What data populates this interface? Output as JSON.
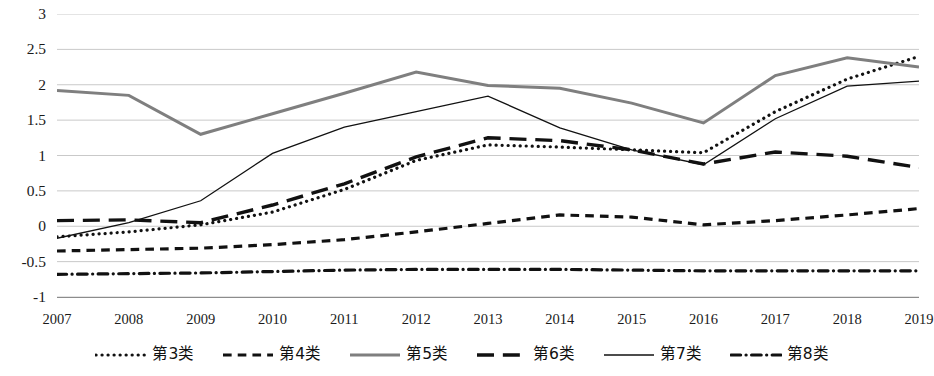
{
  "chart_data": {
    "type": "line",
    "title": "",
    "xlabel": "",
    "ylabel": "",
    "categories": [
      "2007",
      "2008",
      "2009",
      "2010",
      "2011",
      "2012",
      "2013",
      "2014",
      "2015",
      "2016",
      "2017",
      "2018",
      "2019"
    ],
    "x": [
      2007,
      2008,
      2009,
      2010,
      2011,
      2012,
      2013,
      2014,
      2015,
      2016,
      2017,
      2018,
      2019
    ],
    "ylim": [
      -1,
      3
    ],
    "y_ticks": [
      3,
      2.5,
      2,
      1.5,
      1,
      0.5,
      0,
      -0.5,
      -1
    ],
    "y_tick_labels": [
      "3",
      "2.5",
      "2",
      "1.5",
      "1",
      "0.5",
      "0",
      "-0.5",
      "-1"
    ],
    "grid": true,
    "legend_position": "bottom",
    "series": [
      {
        "name": "第3类",
        "style": "dotted",
        "color": "#111111",
        "width": 3.2,
        "values": [
          -0.15,
          -0.08,
          0.02,
          0.2,
          0.52,
          0.93,
          1.15,
          1.12,
          1.08,
          1.04,
          1.62,
          2.08,
          2.4
        ]
      },
      {
        "name": "第4类",
        "style": "dashed",
        "color": "#111111",
        "width": 3.2,
        "values": [
          -0.35,
          -0.33,
          -0.31,
          -0.26,
          -0.19,
          -0.08,
          0.04,
          0.16,
          0.13,
          0.02,
          0.08,
          0.16,
          0.25
        ]
      },
      {
        "name": "第5类",
        "style": "solid",
        "color": "#7f7f7f",
        "width": 3.0,
        "values": [
          1.92,
          1.85,
          1.3,
          1.59,
          1.88,
          2.18,
          1.99,
          1.95,
          1.74,
          1.46,
          2.13,
          2.38,
          2.25
        ]
      },
      {
        "name": "第6类",
        "style": "longdash",
        "color": "#111111",
        "width": 3.4,
        "values": [
          0.08,
          0.09,
          0.05,
          0.3,
          0.6,
          0.98,
          1.25,
          1.21,
          1.08,
          0.88,
          1.05,
          0.99,
          0.83
        ]
      },
      {
        "name": "第7类",
        "style": "solid",
        "color": "#111111",
        "width": 1.3,
        "values": [
          -0.17,
          0.05,
          0.36,
          1.03,
          1.4,
          1.62,
          1.84,
          1.39,
          1.08,
          0.87,
          1.52,
          1.98,
          2.05
        ]
      },
      {
        "name": "第8类",
        "style": "dashdot",
        "color": "#111111",
        "width": 3.2,
        "values": [
          -0.68,
          -0.67,
          -0.66,
          -0.64,
          -0.62,
          -0.61,
          -0.61,
          -0.61,
          -0.62,
          -0.63,
          -0.63,
          -0.63,
          -0.63
        ]
      }
    ]
  },
  "legend": {
    "items": [
      {
        "label": "第3类",
        "key": "dotted-line-key"
      },
      {
        "label": "第4类",
        "key": "dashed-line-key"
      },
      {
        "label": "第5类",
        "key": "solid-gray-line-key"
      },
      {
        "label": "第6类",
        "key": "long-dashed-line-key"
      },
      {
        "label": "第7类",
        "key": "solid-thin-line-key"
      },
      {
        "label": "第8类",
        "key": "dash-dot-line-key"
      }
    ]
  },
  "colors": {
    "grid": "#c9c9c9",
    "axis": "#8c8c8c",
    "text": "#1a1a1a",
    "series_gray": "#7f7f7f",
    "series_black": "#111111"
  }
}
